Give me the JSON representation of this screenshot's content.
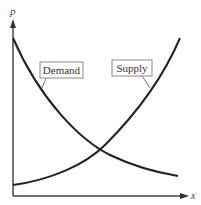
{
  "diagram": {
    "axes": {
      "y_label": "p",
      "x_label": "x"
    },
    "curves": [
      {
        "name": "Demand",
        "label": "Demand",
        "shape": "decreasing convex"
      },
      {
        "name": "Supply",
        "label": "Supply",
        "shape": "increasing convex"
      }
    ],
    "colors": {
      "line": "#222222",
      "label_box": "#888888",
      "background": "#ffffff"
    }
  }
}
